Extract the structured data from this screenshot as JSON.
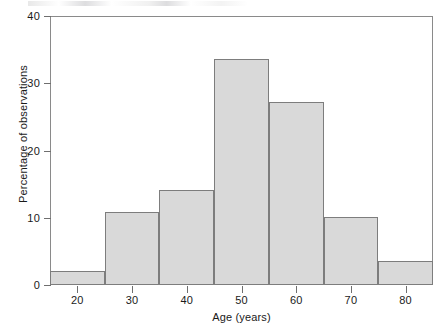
{
  "chart_data": {
    "type": "bar",
    "title": "",
    "xlabel": "Age (years)",
    "ylabel": "Percentage of observations",
    "xlim": [
      15,
      85
    ],
    "ylim": [
      0,
      40
    ],
    "xticks": [
      20,
      30,
      40,
      50,
      60,
      70,
      80
    ],
    "xtick_labels": [
      "20",
      "30",
      "40",
      "50",
      "60",
      "70",
      "80"
    ],
    "yticks": [
      0,
      10,
      20,
      30,
      40
    ],
    "ytick_labels": [
      "0",
      "10",
      "20",
      "30",
      "40"
    ],
    "grid": false,
    "legend": false,
    "bin_width": 10,
    "bin_edges": [
      15,
      25,
      35,
      45,
      55,
      65,
      75,
      85
    ],
    "categories": [
      "15-25",
      "25-35",
      "35-45",
      "45-55",
      "55-65",
      "65-75",
      "75-85"
    ],
    "values": [
      2.1,
      10.8,
      14.2,
      33.6,
      27.2,
      10.1,
      3.6
    ],
    "bar_fill_color": "#d9d9d9",
    "bar_edge_color": "#7d7d7d",
    "axis_color": "#8a8a8a",
    "background_color": "#ffffff"
  }
}
